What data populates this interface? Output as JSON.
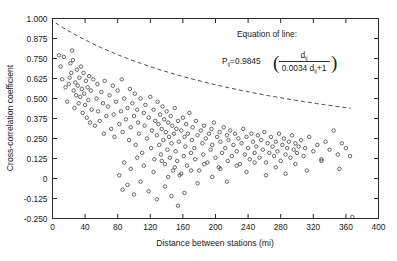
{
  "chart_data": {
    "type": "scatter",
    "title": "",
    "xlabel": "Distance between stations (mi)",
    "ylabel": "Cross-correlation coefficient",
    "xlim": [
      0,
      400
    ],
    "ylim": [
      -0.25,
      1.0
    ],
    "xticks": [
      0,
      40,
      80,
      120,
      160,
      200,
      240,
      280,
      320,
      360,
      400
    ],
    "xtick_labels": [
      "0",
      "40",
      "80",
      "120",
      "160",
      "200",
      "240",
      "280",
      "320",
      "360",
      "400"
    ],
    "yticks": [
      -0.25,
      -0.125,
      0,
      0.125,
      0.25,
      0.375,
      0.5,
      0.625,
      0.75,
      0.875,
      1.0
    ],
    "ytick_labels": [
      "-0.250",
      "-0.125",
      "0",
      "0.125",
      "0.250",
      "0.375",
      "0.500",
      "0.625",
      "0.750",
      "0.875",
      "1.000"
    ],
    "grid": false,
    "legend": null,
    "marker_style": "open-circle",
    "fit_curve": {
      "style": "dashed",
      "label": "Equation of line",
      "x_range": [
        4,
        366
      ],
      "coefficient": 0.9845,
      "decay": 0.0034,
      "form": "P = 0.9845 / (0.0034*d + 1)"
    },
    "x": [
      8,
      10,
      12,
      14,
      16,
      18,
      20,
      21,
      22,
      23,
      24,
      25,
      26,
      27,
      28,
      29,
      30,
      31,
      32,
      33,
      34,
      35,
      36,
      37,
      38,
      39,
      40,
      41,
      42,
      43,
      44,
      45,
      46,
      47,
      48,
      50,
      52,
      54,
      55,
      56,
      58,
      60,
      62,
      63,
      64,
      66,
      68,
      70,
      72,
      74,
      75,
      76,
      78,
      80,
      82,
      84,
      85,
      86,
      88,
      90,
      92,
      94,
      95,
      96,
      98,
      100,
      101,
      102,
      104,
      105,
      106,
      108,
      110,
      112,
      113,
      114,
      116,
      118,
      120,
      121,
      122,
      124,
      125,
      126,
      128,
      129,
      130,
      131,
      132,
      133,
      134,
      135,
      136,
      137,
      138,
      139,
      140,
      141,
      142,
      143,
      144,
      145,
      146,
      147,
      148,
      149,
      150,
      151,
      152,
      153,
      154,
      155,
      156,
      158,
      160,
      161,
      162,
      163,
      164,
      165,
      166,
      168,
      170,
      171,
      172,
      174,
      175,
      176,
      178,
      180,
      182,
      184,
      185,
      186,
      188,
      190,
      192,
      194,
      195,
      196,
      198,
      200,
      202,
      204,
      205,
      206,
      208,
      210,
      212,
      214,
      215,
      216,
      218,
      220,
      222,
      224,
      226,
      228,
      230,
      232,
      234,
      236,
      238,
      240,
      242,
      244,
      246,
      248,
      250,
      252,
      254,
      256,
      258,
      260,
      262,
      264,
      266,
      268,
      270,
      272,
      274,
      276,
      278,
      280,
      282,
      284,
      286,
      288,
      290,
      292,
      294,
      296,
      298,
      300,
      302,
      305,
      308,
      310,
      315,
      320,
      325,
      330,
      335,
      340,
      345,
      350,
      355,
      360,
      365
    ],
    "y": [
      0.77,
      0.7,
      0.62,
      0.76,
      0.57,
      0.48,
      0.59,
      0.63,
      0.72,
      0.66,
      0.8,
      0.74,
      0.55,
      0.44,
      0.6,
      0.52,
      0.68,
      0.58,
      0.47,
      0.63,
      0.51,
      0.7,
      0.56,
      0.41,
      0.66,
      0.53,
      0.46,
      0.61,
      0.38,
      0.57,
      0.49,
      0.64,
      0.35,
      0.55,
      0.43,
      0.62,
      0.33,
      0.5,
      0.59,
      0.42,
      0.36,
      0.54,
      0.47,
      0.28,
      0.61,
      0.39,
      0.45,
      0.52,
      0.31,
      0.58,
      0.4,
      0.26,
      0.48,
      0.55,
      0.34,
      0.42,
      0.62,
      0.29,
      0.5,
      0.37,
      0.44,
      0.24,
      0.56,
      0.32,
      0.47,
      0.39,
      0.53,
      0.21,
      0.43,
      0.35,
      0.28,
      0.5,
      0.16,
      0.41,
      0.33,
      0.46,
      0.25,
      0.38,
      0.51,
      0.19,
      0.3,
      0.43,
      0.12,
      0.36,
      0.27,
      0.48,
      0.34,
      0.21,
      0.4,
      0.15,
      0.31,
      0.45,
      0.24,
      0.37,
      0.09,
      0.29,
      0.42,
      0.18,
      0.35,
      0.26,
      0.13,
      0.39,
      0.22,
      0.33,
      0.05,
      0.28,
      0.44,
      0.17,
      0.31,
      0.11,
      0.36,
      0.23,
      0.02,
      0.3,
      0.38,
      0.14,
      0.26,
      0.2,
      0.34,
      0.08,
      0.28,
      0.41,
      0.16,
      0.24,
      0.32,
      0.19,
      0.12,
      0.36,
      0.27,
      0.05,
      0.3,
      0.22,
      0.15,
      0.33,
      0.25,
      0.1,
      0.28,
      0.18,
      0.31,
      0.21,
      0.35,
      0.13,
      0.26,
      0.07,
      0.29,
      0.23,
      0.16,
      0.32,
      0.19,
      0.27,
      0.11,
      0.24,
      0.3,
      0.14,
      0.21,
      0.28,
      0.17,
      0.25,
      0.09,
      0.22,
      0.31,
      0.15,
      0.26,
      0.19,
      0.12,
      0.28,
      0.23,
      0.16,
      0.2,
      0.27,
      0.13,
      0.24,
      0.18,
      0.29,
      0.1,
      0.22,
      0.16,
      0.26,
      0.2,
      0.14,
      0.23,
      0.17,
      0.28,
      0.11,
      0.21,
      0.25,
      0.15,
      0.19,
      0.23,
      0.13,
      0.27,
      0.18,
      0.22,
      0.16,
      0.2,
      0.24,
      0.14,
      0.19,
      0.26,
      0.17,
      0.21,
      0.12,
      0.23,
      0.18,
      0.3,
      0.15,
      0.22,
      0.19,
      0.14,
      0.24,
      0.18,
      0.28
    ],
    "extra_low_points": {
      "x": [
        82,
        86,
        88,
        92,
        96,
        100,
        104,
        108,
        112,
        118,
        124,
        128,
        134,
        138,
        142,
        146,
        150,
        154,
        158,
        162,
        170,
        178,
        186,
        196,
        206,
        214,
        226,
        238,
        248,
        262,
        274,
        286,
        298,
        312,
        330,
        352,
        368
      ],
      "y": [
        0.02,
        -0.07,
        0.1,
        -0.04,
        0.06,
        -0.1,
        0.13,
        -0.02,
        0.08,
        -0.08,
        0.04,
        -0.13,
        0.11,
        -0.05,
        0.01,
        -0.11,
        0.07,
        -0.17,
        0.03,
        -0.09,
        0.05,
        -0.03,
        0.09,
        0.01,
        0.06,
        -0.02,
        0.08,
        0.04,
        0.1,
        0.02,
        0.07,
        0.03,
        0.09,
        0.05,
        0.11,
        0.06,
        -0.24
      ]
    },
    "equation": {
      "heading": "Equation of line:",
      "lhs": "P",
      "lhs_sub": "ij",
      "equals": "=0.9845",
      "numerator": "d",
      "numerator_sub": "ij",
      "denominator_a": "0.0034 d",
      "denominator_sub": "ij",
      "denominator_b": "+1"
    }
  }
}
